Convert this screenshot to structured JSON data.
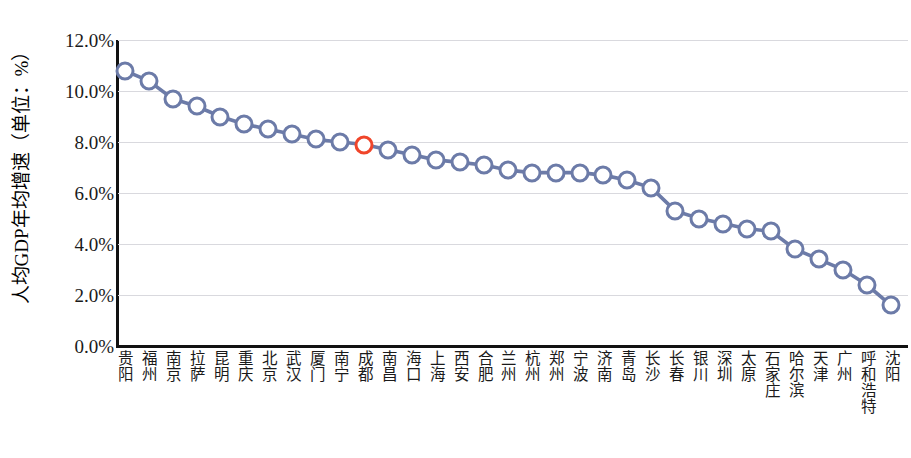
{
  "chart_data": {
    "type": "line",
    "title": "",
    "xlabel": "",
    "ylabel": "人均GDP年均增速（单位：%）",
    "ylim": [
      0,
      12
    ],
    "ytick_labels": [
      "12.0%",
      "10.0%",
      "8.0%",
      "6.0%",
      "4.0%",
      "2.0%",
      "0.0%"
    ],
    "ytick_values": [
      12,
      10,
      8,
      6,
      4,
      2,
      0
    ],
    "grid": true,
    "legend": "none",
    "series_color": "#6c7ba8",
    "highlight_color": "#f0452a",
    "highlight_category": "成都",
    "categories": [
      "贵阳",
      "福州",
      "南京",
      "拉萨",
      "昆明",
      "重庆",
      "北京",
      "武汉",
      "厦门",
      "南宁",
      "成都",
      "南昌",
      "海口",
      "上海",
      "西安",
      "合肥",
      "兰州",
      "杭州",
      "郑州",
      "宁波",
      "济南",
      "青岛",
      "长沙",
      "长春",
      "银川",
      "深圳",
      "太原",
      "石家庄",
      "哈尔滨",
      "天津",
      "广州",
      "呼和浩特",
      "沈阳"
    ],
    "values": [
      10.8,
      10.4,
      9.7,
      9.4,
      9.0,
      8.7,
      8.5,
      8.3,
      8.1,
      8.0,
      7.9,
      7.7,
      7.5,
      7.3,
      7.2,
      7.1,
      6.9,
      6.8,
      6.8,
      6.8,
      6.7,
      6.5,
      6.2,
      5.3,
      5.0,
      4.8,
      4.6,
      4.5,
      3.8,
      3.4,
      3.0,
      2.4,
      1.6
    ]
  }
}
